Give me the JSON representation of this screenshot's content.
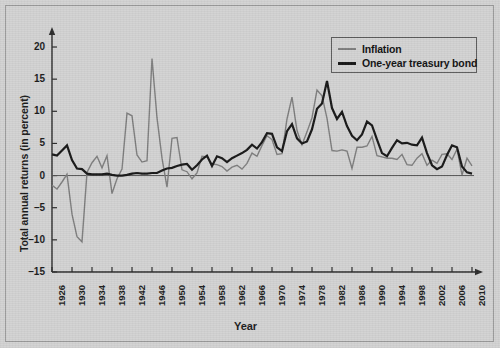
{
  "chart_data": {
    "type": "line",
    "title": "",
    "xlabel": "Year",
    "ylabel": "Total annual returns (in percent)",
    "xlim": [
      1926,
      2010
    ],
    "ylim": [
      -15,
      22
    ],
    "yticks": [
      20,
      15,
      10,
      5,
      0,
      -5,
      -10,
      -15
    ],
    "ytick_labels": [
      "20",
      "15",
      "10",
      "5",
      "0",
      "–5",
      "–10",
      "–15"
    ],
    "xticks": [
      1926,
      1930,
      1934,
      1938,
      1942,
      1946,
      1950,
      1954,
      1958,
      1962,
      1966,
      1970,
      1974,
      1978,
      1982,
      1986,
      1990,
      1994,
      1998,
      2002,
      2006,
      2010
    ],
    "xtick_labels": [
      "1926",
      "1930",
      "1934",
      "1938",
      "1942",
      "1946",
      "1950",
      "1954",
      "1958",
      "1962",
      "1966",
      "1970",
      "1974",
      "1978",
      "1982",
      "1986",
      "1990",
      "1994",
      "1998",
      "2002",
      "2006",
      "2010"
    ],
    "grid": false,
    "legend_position": "top-right",
    "x": [
      1926,
      1927,
      1928,
      1929,
      1930,
      1931,
      1932,
      1933,
      1934,
      1935,
      1936,
      1937,
      1938,
      1939,
      1940,
      1941,
      1942,
      1943,
      1944,
      1945,
      1946,
      1947,
      1948,
      1949,
      1950,
      1951,
      1952,
      1953,
      1954,
      1955,
      1956,
      1957,
      1958,
      1959,
      1960,
      1961,
      1962,
      1963,
      1964,
      1965,
      1966,
      1967,
      1968,
      1969,
      1970,
      1971,
      1972,
      1973,
      1974,
      1975,
      1976,
      1977,
      1978,
      1979,
      1980,
      1981,
      1982,
      1983,
      1984,
      1985,
      1986,
      1987,
      1988,
      1989,
      1990,
      1991,
      1992,
      1993,
      1994,
      1995,
      1996,
      1997,
      1998,
      1999,
      2000,
      2001,
      2002,
      2003,
      2004,
      2005,
      2006,
      2007,
      2008,
      2009,
      2010
    ],
    "series": [
      {
        "name": "Inflation",
        "color": "#7d7d7d",
        "width": 1.4,
        "values": [
          -1.5,
          -2.1,
          -1.0,
          0.2,
          -6.0,
          -9.5,
          -10.3,
          0.5,
          2.0,
          3.0,
          1.2,
          3.1,
          -2.8,
          -0.5,
          1.0,
          9.7,
          9.3,
          3.2,
          2.1,
          2.3,
          18.2,
          9.0,
          2.7,
          -1.8,
          5.8,
          5.9,
          0.9,
          0.6,
          -0.5,
          0.4,
          3.0,
          2.9,
          1.8,
          1.7,
          1.4,
          0.7,
          1.3,
          1.6,
          1.0,
          1.9,
          3.5,
          3.0,
          4.7,
          6.2,
          5.6,
          3.3,
          3.4,
          8.8,
          12.2,
          7.0,
          4.8,
          6.8,
          9.0,
          13.3,
          12.4,
          8.9,
          3.9,
          3.8,
          4.0,
          3.8,
          1.1,
          4.4,
          4.4,
          4.6,
          6.1,
          3.1,
          2.9,
          2.7,
          2.7,
          2.5,
          3.3,
          1.7,
          1.6,
          2.7,
          3.4,
          1.6,
          2.4,
          1.9,
          3.3,
          3.4,
          2.5,
          4.1,
          0.1,
          2.7,
          1.5
        ]
      },
      {
        "name": "One-year treasury bond",
        "color": "#171717",
        "width": 2.2,
        "values": [
          3.3,
          3.1,
          3.9,
          4.7,
          2.4,
          1.1,
          1.0,
          0.3,
          0.2,
          0.2,
          0.2,
          0.3,
          0.1,
          0.0,
          0.0,
          0.1,
          0.3,
          0.4,
          0.3,
          0.3,
          0.4,
          0.4,
          0.8,
          1.1,
          1.2,
          1.5,
          1.7,
          1.8,
          0.9,
          1.6,
          2.5,
          3.1,
          1.5,
          3.0,
          2.7,
          2.1,
          2.7,
          3.1,
          3.5,
          4.0,
          4.8,
          4.2,
          5.2,
          6.6,
          6.5,
          4.4,
          3.8,
          6.9,
          8.0,
          5.8,
          5.0,
          5.3,
          7.2,
          10.4,
          11.2,
          14.7,
          10.5,
          8.8,
          9.9,
          7.7,
          6.2,
          5.5,
          6.4,
          8.4,
          7.8,
          5.6,
          3.5,
          3.0,
          4.3,
          5.5,
          5.0,
          5.1,
          4.8,
          4.7,
          5.9,
          3.5,
          1.6,
          1.0,
          1.4,
          3.2,
          4.7,
          4.4,
          1.4,
          0.5,
          0.3
        ]
      }
    ]
  },
  "legend": {
    "items": [
      {
        "label": "Inflation",
        "color": "#7d7d7d"
      },
      {
        "label": "One-year treasury bond",
        "color": "#171717"
      }
    ]
  },
  "axes": {
    "ylabel": "Total annual returns (in percent)",
    "xlabel": "Year"
  }
}
